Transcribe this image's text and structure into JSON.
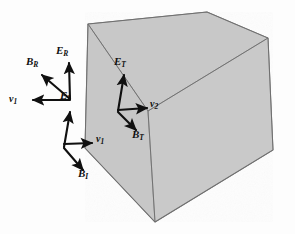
{
  "figure": {
    "type": "physics-vector-diagram",
    "background_color": "#fdfdfd",
    "medium_fill_color": "#c8c8c8",
    "outline_color": "#6b6b6b",
    "arrow_color": "#101010",
    "medium": {
      "shape": "cube",
      "description": "Shaded cube representing the second dielectric medium"
    },
    "wave_groups": [
      {
        "id": "reflected",
        "name": "reflected-wave",
        "origin": [
          70,
          99
        ],
        "vectors": [
          {
            "name": "E-reflected-vector",
            "symbol": "E",
            "subscript": "R",
            "direction": "up",
            "tip": [
              69,
              61
            ],
            "label_pos": [
              58,
              52
            ]
          },
          {
            "name": "B-reflected-vector",
            "symbol": "B",
            "subscript": "R",
            "direction": "up-left",
            "tip": [
              40,
              74
            ],
            "label_pos": [
              28,
              63
            ]
          },
          {
            "name": "v1-reflected-vector",
            "symbol": "v",
            "subscript": "1",
            "direction": "left",
            "tip": [
              31,
              100
            ],
            "label_pos": [
              12,
              100
            ]
          }
        ]
      },
      {
        "id": "incident",
        "name": "incident-wave",
        "origin": [
          64,
          147
        ],
        "vectors": [
          {
            "name": "E-incident-vector",
            "symbol": "E",
            "subscript": "I",
            "direction": "up",
            "tip": [
              70,
              110
            ],
            "label_pos": [
              62,
              96
            ]
          },
          {
            "name": "v1-incident-vector",
            "symbol": "v",
            "subscript": "1",
            "direction": "right",
            "tip": [
              94,
              143
            ],
            "label_pos": [
              97,
              140
            ]
          },
          {
            "name": "B-incident-vector",
            "symbol": "B",
            "subscript": "I",
            "direction": "down-right",
            "tip": [
              85,
              172
            ],
            "label_pos": [
              80,
              174
            ]
          }
        ]
      },
      {
        "id": "transmitted",
        "name": "transmitted-wave",
        "origin": [
          118,
          111
        ],
        "vectors": [
          {
            "name": "E-transmitted-vector",
            "symbol": "E",
            "subscript": "T",
            "direction": "up-left",
            "tip": [
              124,
              73
            ],
            "label_pos": [
              116,
              63
            ]
          },
          {
            "name": "v2-transmitted-vector",
            "symbol": "v",
            "subscript": "2",
            "direction": "right",
            "tip": [
              149,
              108
            ],
            "label_pos": [
              152,
              105
            ]
          },
          {
            "name": "B-transmitted-vector",
            "symbol": "B",
            "subscript": "T",
            "direction": "down-right",
            "tip": [
              138,
              132
            ],
            "label_pos": [
              134,
              134
            ]
          }
        ]
      }
    ],
    "labels": {
      "E_R": "E",
      "E_R_sub": "R",
      "B_R": "B",
      "B_R_sub": "R",
      "v_1_reflected": "v",
      "v_1_reflected_sub": "1",
      "E_I": "E",
      "E_I_sub": "I",
      "v_1_incident": "v",
      "v_1_incident_sub": "1",
      "B_I": "B",
      "B_I_sub": "I",
      "E_T": "E",
      "E_T_sub": "T",
      "v_2": "v",
      "v_2_sub": "2",
      "B_T": "B",
      "B_T_sub": "T"
    }
  }
}
